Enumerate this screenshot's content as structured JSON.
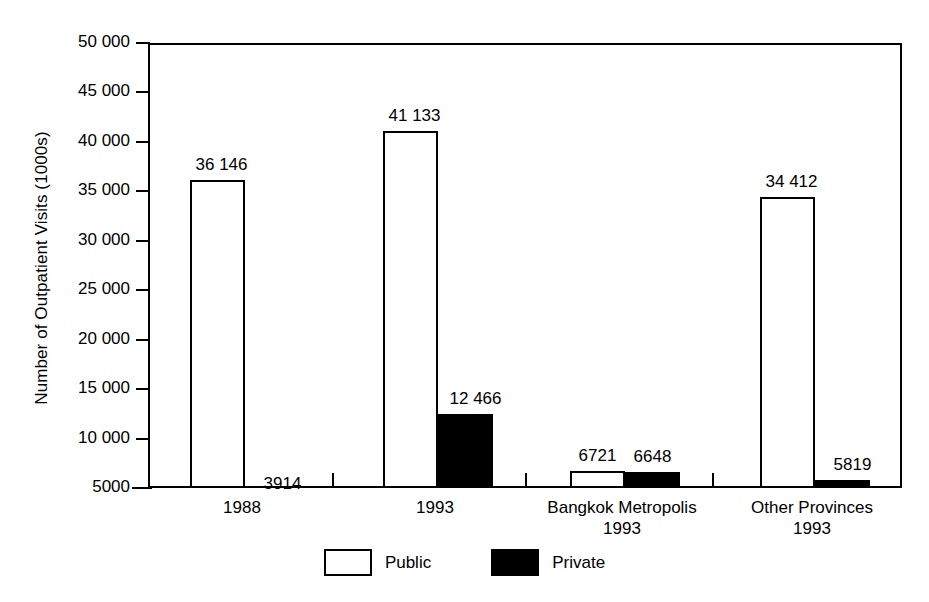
{
  "chart_data": {
    "type": "bar",
    "title": "",
    "subtitle": "",
    "xlabel": "",
    "ylabel": "Number of Outpatient Visits (1000s)",
    "ylim": [
      5000,
      50000
    ],
    "ytick_labels": [
      "50 000",
      "45 000",
      "40 000",
      "35 000",
      "30 000",
      "25 000",
      "20 000",
      "15 000",
      "10 000",
      "5000"
    ],
    "ytick_values": [
      50000,
      45000,
      40000,
      35000,
      30000,
      25000,
      20000,
      15000,
      10000,
      5000
    ],
    "grid": false,
    "legend_position": "bottom-center",
    "categories": [
      "1988",
      "1993",
      "Bangkok Metropolis 1993",
      "Other Provinces 1993"
    ],
    "category_lines": [
      [
        "1988",
        ""
      ],
      [
        "1993",
        ""
      ],
      [
        "Bangkok Metropolis",
        "1993"
      ],
      [
        "Other Provinces",
        "1993"
      ]
    ],
    "series": [
      {
        "name": "Public",
        "color": "#ffffff",
        "values": [
          36146,
          41133,
          6721,
          34412
        ],
        "labels": [
          "36 146",
          "41 133",
          "6721",
          "34 412"
        ]
      },
      {
        "name": "Private",
        "color": "#000000",
        "values": [
          3914,
          12466,
          6648,
          5819
        ],
        "labels": [
          "3914",
          "12 466",
          "6648",
          "5819"
        ]
      }
    ]
  },
  "legend": {
    "items": [
      {
        "label": "Public",
        "swatch": "public"
      },
      {
        "label": "Private",
        "swatch": "private"
      }
    ]
  },
  "axis": {
    "y_title": "Number of Outpatient Visits (1000s)"
  }
}
